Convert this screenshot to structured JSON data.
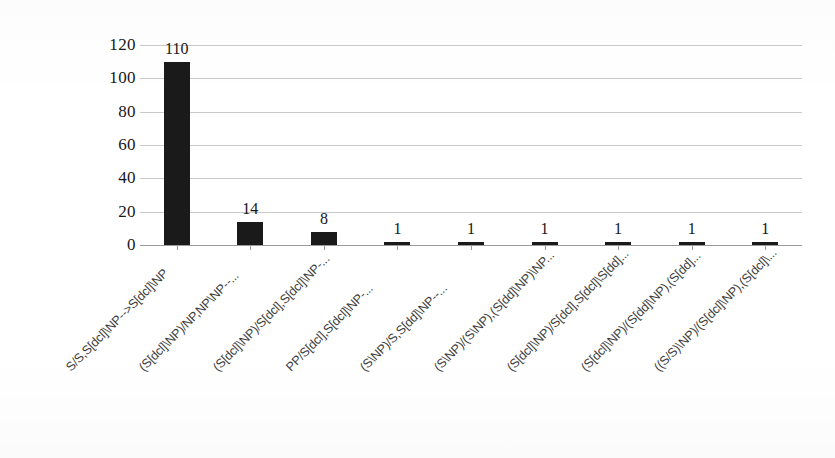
{
  "chart_data": {
    "type": "bar",
    "title": "",
    "subtitle": "",
    "xlabel": "",
    "ylabel": "",
    "ylim": [
      0,
      120
    ],
    "yticks": [
      0,
      20,
      40,
      60,
      80,
      100,
      120
    ],
    "ytick_labels": [
      "0",
      "20",
      "40",
      "60",
      "80",
      "100",
      "120"
    ],
    "grid": true,
    "grid_axis": "y",
    "legend": false,
    "legend_position": "none",
    "orientation": "vertical",
    "bar_color": "#1a1a1a",
    "gridline_color": "#c9c9c9",
    "axis_color": "#9a9a9a",
    "categories": [
      "S/S,S[dcl]\\NP-->S[dcl]\\NP",
      "(S[dcl]\\NP)/NP,NP\\NP--...",
      "(S[dcl]\\NP)/S[dcl],S[dcl]\\NP-...",
      "PP/S[dcl],S[dcl]\\NP-...",
      "(S\\NP)/S,S[dd]\\NP--...",
      "(S\\NP)/(S\\NP),(S[dd]\\NP)\\NP...",
      "(S[dcl]\\NP)/S[dcl],S[dcl]\\S[dd]...",
      "(S[dcl]\\NP)/(S[dd]\\NP),(S[dd]...",
      "((S/S)\\NP)/(S[dcl]\\NP),(S[dcl]\\..."
    ],
    "values": [
      110,
      14,
      8,
      1,
      1,
      1,
      1,
      1,
      1
    ],
    "data_labels": [
      "110",
      "14",
      "8",
      "1",
      "1",
      "1",
      "1",
      "1",
      "1"
    ]
  }
}
